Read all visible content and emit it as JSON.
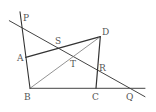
{
  "diagram": {
    "type": "geometry",
    "colors": {
      "background": "#ffffff",
      "thick_line": "#333333",
      "thin_line": "#555555",
      "label": "#555555"
    },
    "points": {
      "P": {
        "label": "P",
        "x": 21.3,
        "y": 27.3,
        "lx": 23,
        "ly": 21
      },
      "A": {
        "label": "A",
        "x": 25.7,
        "y": 57.3,
        "lx": 17,
        "ly": 61
      },
      "B": {
        "label": "B",
        "x": 30,
        "y": 88.3,
        "lx": 24,
        "ly": 100
      },
      "C": {
        "label": "C",
        "x": 96,
        "y": 88.3,
        "lx": 92,
        "ly": 100
      },
      "D": {
        "label": "D",
        "x": 100.3,
        "y": 36.7,
        "lx": 102,
        "ly": 35
      },
      "S": {
        "label": "S",
        "x": 58.7,
        "y": 46.7,
        "lx": 55,
        "ly": 44
      },
      "T": {
        "label": "T",
        "x": 72.7,
        "y": 56,
        "lx": 70,
        "ly": 67
      },
      "R": {
        "label": "R",
        "x": 96.3,
        "y": 68,
        "lx": 99,
        "ly": 71
      },
      "Q": {
        "label": "Q",
        "x": 128.7,
        "y": 88.3,
        "lx": 126,
        "ly": 100
      }
    },
    "segments": [
      {
        "name": "line-PQ",
        "from": "ext",
        "x1": 9.3,
        "y1": 20.7,
        "x2": 145,
        "y2": 96.7,
        "width": 1.0,
        "color": "#444444"
      },
      {
        "name": "line-PB",
        "x1": 20,
        "y1": 11.7,
        "x2": 30,
        "y2": 88.3,
        "width": 1.1,
        "color": "#333333"
      },
      {
        "name": "segment-AD",
        "x1": 25.7,
        "y1": 57.3,
        "x2": 100.3,
        "y2": 36.7,
        "width": 1.3,
        "color": "#333333"
      },
      {
        "name": "segment-BD",
        "x1": 30,
        "y1": 88.3,
        "x2": 100.3,
        "y2": 36.7,
        "width": 0.8,
        "color": "#777777"
      },
      {
        "name": "segment-DC",
        "x1": 100.3,
        "y1": 36.7,
        "x2": 96,
        "y2": 88.3,
        "width": 1.2,
        "color": "#333333"
      },
      {
        "name": "line-BC",
        "x1": 30,
        "y1": 88.3,
        "x2": 145,
        "y2": 88.3,
        "width": 1.0,
        "color": "#444444"
      }
    ]
  }
}
